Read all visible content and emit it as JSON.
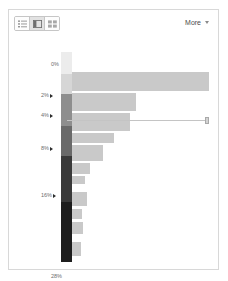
{
  "panel": {
    "toolbar": {
      "view_toggle": {
        "name": "view-mode-toggle",
        "buttons": [
          {
            "icon": "list-view-icon",
            "label": "List view",
            "selected": false
          },
          {
            "icon": "split-view-icon",
            "label": "Split view",
            "selected": true
          },
          {
            "icon": "grid-view-icon",
            "label": "Grid view",
            "selected": false
          }
        ]
      },
      "more_label": "More",
      "more_caret_icon": "chevron-down-icon"
    }
  },
  "chart_data": {
    "type": "bar",
    "orientation": "horizontal",
    "title": "",
    "xlabel": "",
    "ylabel": "",
    "grid": false,
    "legend": null,
    "axis_tick_labels": [
      "0%",
      "2%",
      "4%",
      "8%",
      "16%",
      "28%"
    ],
    "categories": [
      "0%",
      "2%",
      "4%",
      "8%",
      "16%",
      "28%"
    ],
    "values": [
      100,
      46,
      42,
      22,
      13,
      6
    ],
    "bars": [
      {
        "label": "0%",
        "value": 100,
        "width_px": 137,
        "top_px": 20,
        "height_px": 19,
        "color": "#c9c9c9"
      },
      {
        "label": "2%",
        "value": 46,
        "width_px": 64,
        "top_px": 41,
        "height_px": 18,
        "color": "#c9c9c9"
      },
      {
        "label": "4%",
        "value": 42,
        "width_px": 58,
        "top_px": 61,
        "height_px": 18,
        "color": "#c9c9c9"
      },
      {
        "label": "",
        "value": 30,
        "width_px": 42,
        "top_px": 81,
        "height_px": 10,
        "color": "#c9c9c9"
      },
      {
        "label": "8%",
        "value": 22,
        "width_px": 31,
        "top_px": 93,
        "height_px": 16,
        "color": "#c9c9c9"
      },
      {
        "label": "",
        "value": 13,
        "width_px": 18,
        "top_px": 111,
        "height_px": 11,
        "color": "#c9c9c9"
      },
      {
        "label": "",
        "value": 9,
        "width_px": 13,
        "top_px": 124,
        "height_px": 8,
        "color": "#c9c9c9"
      },
      {
        "label": "16%",
        "value": 11,
        "width_px": 15,
        "top_px": 140,
        "height_px": 14,
        "color": "#c9c9c9"
      },
      {
        "label": "",
        "value": 7,
        "width_px": 10,
        "top_px": 157,
        "height_px": 10,
        "color": "#c9c9c9"
      },
      {
        "label": "",
        "value": 8,
        "width_px": 11,
        "top_px": 170,
        "height_px": 12,
        "color": "#c9c9c9"
      },
      {
        "label": "28%",
        "value": 6,
        "width_px": 9,
        "top_px": 190,
        "height_px": 14,
        "color": "#c9c9c9"
      }
    ],
    "connector": {
      "label": "value-connector-line",
      "start_px": 58,
      "end_px": 196,
      "top_px": 68,
      "handle_icon": "drag-handle"
    },
    "ticks": [
      {
        "label": "0%",
        "top_px": 10,
        "marker": false
      },
      {
        "label": "2%",
        "top_px": 41,
        "marker": true
      },
      {
        "label": "4%",
        "top_px": 61,
        "marker": true
      },
      {
        "label": "8%",
        "top_px": 94,
        "marker": true
      },
      {
        "label": "16%",
        "top_px": 141,
        "marker": true
      },
      {
        "label": "28%",
        "top_px": 222,
        "marker": false
      }
    ],
    "spine": {
      "label": "gradient-spine",
      "segments": [
        {
          "top_px": 0,
          "height_px": 22,
          "color": "#ececec"
        },
        {
          "top_px": 22,
          "height_px": 20,
          "color": "#d6d6d6"
        },
        {
          "top_px": 42,
          "height_px": 32,
          "color": "#8e8e8e"
        },
        {
          "top_px": 74,
          "height_px": 30,
          "color": "#6a6a6a"
        },
        {
          "top_px": 104,
          "height_px": 46,
          "color": "#3a3a3a"
        },
        {
          "top_px": 150,
          "height_px": 60,
          "color": "#1e1e1e"
        }
      ]
    }
  }
}
